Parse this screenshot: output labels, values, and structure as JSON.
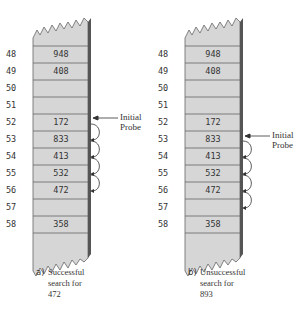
{
  "figure": {
    "colors": {
      "cell_fill": "#d6d6d6",
      "cell_border": "#666666",
      "shadow": "#555555",
      "text": "#333333"
    },
    "rows": [
      48,
      49,
      50,
      51,
      52,
      53,
      54,
      55,
      56,
      57,
      58
    ],
    "panels": [
      {
        "id": "a",
        "cells": [
          "948",
          "408",
          "",
          "",
          "172",
          "833",
          "413",
          "532",
          "472",
          "",
          "358"
        ],
        "probe_label_line1": "Initial",
        "probe_label_line2": "Probe",
        "initial_probe_row": 52,
        "probe_hops": [
          [
            52,
            53
          ],
          [
            53,
            54
          ],
          [
            54,
            55
          ],
          [
            55,
            56
          ]
        ],
        "caption_tag": "a)",
        "caption_lines": [
          "Successful",
          "search for",
          "472"
        ]
      },
      {
        "id": "b",
        "cells": [
          "948",
          "408",
          "",
          "",
          "172",
          "833",
          "413",
          "532",
          "472",
          "",
          "358"
        ],
        "probe_label_line1": "Initial",
        "probe_label_line2": "Probe",
        "initial_probe_row": 53,
        "probe_hops": [
          [
            53,
            54
          ],
          [
            54,
            55
          ],
          [
            55,
            56
          ],
          [
            56,
            57
          ]
        ],
        "caption_tag": "b)",
        "caption_lines": [
          "Unsuccessful",
          "search for",
          "893"
        ]
      }
    ],
    "row_labels": [
      "48",
      "49",
      "50",
      "51",
      "52",
      "53",
      "54",
      "55",
      "56",
      "57",
      "58"
    ]
  }
}
